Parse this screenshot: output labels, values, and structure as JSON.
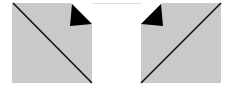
{
  "diagram": {
    "colors": {
      "background": "#ffffff",
      "panel_fill": "#c9c9c9",
      "line": "#111111",
      "fold": "#000000",
      "center_border": "#dddddd"
    },
    "left_panel": {
      "x": 12,
      "y": 3,
      "w": 80,
      "h": 80,
      "diagonal": "top-left to bottom-right",
      "fold_corner": "top-right"
    },
    "right_panel": {
      "x": 141,
      "y": 3,
      "w": 80,
      "h": 80,
      "diagonal": "top-right to bottom-left",
      "fold_corner": "top-left"
    },
    "center_panel": {
      "x": 92,
      "y": 3,
      "w": 49,
      "h": 80
    }
  }
}
